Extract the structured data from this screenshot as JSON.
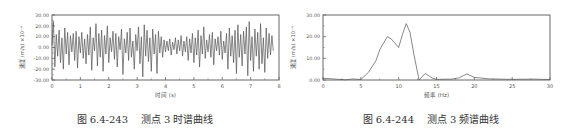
{
  "chart_data": [
    {
      "type": "line",
      "title": "",
      "caption": "图 6.4-243    测点 3 时谱曲线",
      "xlabel": "时间 (s)",
      "ylabel": "速度 (m/s) ×10⁻⁴",
      "xlim": [
        0,
        8
      ],
      "ylim": [
        -30,
        30
      ],
      "x_ticks": [
        "0",
        "1",
        "2",
        "3",
        "4",
        "5",
        "6",
        "7",
        "8"
      ],
      "y_ticks": [
        "30.00",
        "20.00",
        "10.00",
        "0.00",
        "-10.00",
        "-20.00",
        "-30.00"
      ],
      "grid": false,
      "legend": null,
      "series": [
        {
          "name": "测点3 时程",
          "description": "random vibration velocity signal oscillating roughly between -28 and +26",
          "x": [
            0.0,
            0.05,
            0.1,
            0.15,
            0.2,
            0.25,
            0.3,
            0.35,
            0.4,
            0.45,
            0.5,
            0.55,
            0.6,
            0.65,
            0.7,
            0.75,
            0.8,
            0.85,
            0.9,
            0.95,
            1.0,
            1.05,
            1.1,
            1.15,
            1.2,
            1.25,
            1.3,
            1.35,
            1.4,
            1.45,
            1.5,
            1.55,
            1.6,
            1.65,
            1.7,
            1.75,
            1.8,
            1.85,
            1.9,
            1.95,
            2.0,
            2.05,
            2.1,
            2.15,
            2.2,
            2.25,
            2.3,
            2.35,
            2.4,
            2.45,
            2.5,
            2.55,
            2.6,
            2.65,
            2.7,
            2.75,
            2.8,
            2.85,
            2.9,
            2.95,
            3.0,
            3.05,
            3.1,
            3.15,
            3.2,
            3.25,
            3.3,
            3.35,
            3.4,
            3.45,
            3.5,
            3.55,
            3.6,
            3.65,
            3.7,
            3.75,
            3.8,
            3.85,
            3.9,
            3.95,
            4.0,
            4.05,
            4.1,
            4.15,
            4.2,
            4.25,
            4.3,
            4.35,
            4.4,
            4.45,
            4.5,
            4.55,
            4.6,
            4.65,
            4.7,
            4.75,
            4.8,
            4.85,
            4.9,
            4.95,
            5.0,
            5.05,
            5.1,
            5.15,
            5.2,
            5.25,
            5.3,
            5.35,
            5.4,
            5.45,
            5.5,
            5.55,
            5.6,
            5.65,
            5.7,
            5.75,
            5.8,
            5.85,
            5.9,
            5.95,
            6.0,
            6.05,
            6.1,
            6.15,
            6.2,
            6.25,
            6.3,
            6.35,
            6.4,
            6.45,
            6.5,
            6.55,
            6.6,
            6.65,
            6.7,
            6.75,
            6.8,
            6.85,
            6.9,
            6.95,
            7.0,
            7.05,
            7.1,
            7.15,
            7.2,
            7.25,
            7.3,
            7.35,
            7.4,
            7.45,
            7.5,
            7.55,
            7.6,
            7.65,
            7.7,
            7.75,
            7.8,
            7.85,
            7.9,
            7.95,
            8.0
          ],
          "y": [
            2,
            24,
            -18,
            12,
            -8,
            16,
            -14,
            9,
            -20,
            18,
            -6,
            14,
            -16,
            11,
            -4,
            13,
            -12,
            15,
            -19,
            10,
            -5,
            14,
            -10,
            8,
            -15,
            12,
            -7,
            19,
            -21,
            9,
            -3,
            22,
            -17,
            13,
            -9,
            16,
            -22,
            11,
            -6,
            20,
            -14,
            9,
            -4,
            15,
            -11,
            13,
            -18,
            10,
            -2,
            17,
            -25,
            8,
            -5,
            14,
            -12,
            18,
            -9,
            6,
            -20,
            12,
            -3,
            19,
            -15,
            10,
            -27,
            21,
            -8,
            16,
            -13,
            9,
            -22,
            17,
            -6,
            12,
            -24,
            15,
            -5,
            10,
            -9,
            7,
            -4,
            6,
            -3,
            8,
            -7,
            5,
            -2,
            9,
            -6,
            7,
            -3,
            11,
            -8,
            6,
            -4,
            10,
            -12,
            8,
            -5,
            13,
            -14,
            9,
            -7,
            16,
            -18,
            11,
            -6,
            19,
            -10,
            7,
            -4,
            12,
            -9,
            14,
            -16,
            8,
            -3,
            10,
            -7,
            15,
            -11,
            6,
            -5,
            13,
            -20,
            18,
            -8,
            11,
            -14,
            16,
            -24,
            21,
            -9,
            12,
            -17,
            15,
            -6,
            19,
            -26,
            24,
            -12,
            10,
            -22,
            17,
            -8,
            14,
            -20,
            22,
            -15,
            9,
            -23,
            18,
            -10,
            13,
            -7,
            11,
            -3
          ],
          "color": "#555555"
        }
      ]
    },
    {
      "type": "line",
      "title": "",
      "caption": "图 6.4-244    测点 3 频谱曲线",
      "xlabel": "频率 (Hz)",
      "ylabel": "速度 (m/s) ×10⁻⁴",
      "xlim": [
        0,
        30
      ],
      "ylim": [
        0,
        30
      ],
      "x_ticks": [
        "0",
        "5",
        "10",
        "15",
        "20",
        "25",
        "30"
      ],
      "y_ticks": [
        "30.00",
        "20.00",
        "10.00",
        "0.00"
      ],
      "grid": false,
      "legend": null,
      "series": [
        {
          "name": "测点3 频谱",
          "x": [
            0,
            1,
            2,
            3,
            4,
            5,
            6,
            7,
            7.5,
            8,
            8.5,
            9,
            10,
            10.5,
            11,
            11.5,
            12,
            12.7,
            13.5,
            14.5,
            15,
            17,
            18,
            19,
            20,
            22,
            25,
            28,
            30
          ],
          "y": [
            0.8,
            0.6,
            0.3,
            0.1,
            0.5,
            0.2,
            3.5,
            9,
            14,
            17,
            20,
            19,
            15,
            21,
            26,
            22,
            12,
            0,
            3,
            0.8,
            0.3,
            0.4,
            1,
            2.8,
            1.2,
            0.5,
            0.3,
            0.4,
            0.2
          ],
          "color": "#555555"
        }
      ]
    }
  ],
  "figures": {
    "left": {
      "caption": "图 6.4-243    测点 3 时谱曲线",
      "xlabel": "时间 (s)",
      "ylabel": "速度 (m/s) ×10⁻⁴"
    },
    "right": {
      "caption": "图 6.4-244    测点 3 频谱曲线",
      "xlabel": "频率 (Hz)",
      "ylabel": "速度 (m/s) ×10⁻⁴"
    }
  }
}
